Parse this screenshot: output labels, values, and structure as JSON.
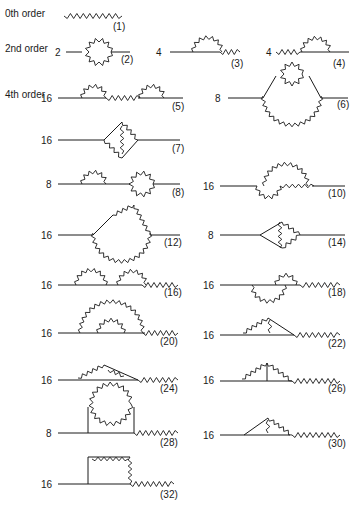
{
  "figure": {
    "order_labels": [
      {
        "text": "0th order",
        "x": 5,
        "y": 17
      },
      {
        "text": "2nd order",
        "x": 5,
        "y": 52
      },
      {
        "text": "4th order",
        "x": 5,
        "y": 98
      }
    ],
    "diagrams": [
      {
        "id": "1",
        "tag": "(1)",
        "weight": "",
        "pos": [
          64,
          12
        ],
        "label_pos": [
          113,
          30
        ]
      },
      {
        "id": "2",
        "tag": "(2)",
        "weight": "2",
        "pos": [
          62,
          52
        ],
        "label_pos": [
          121,
          63
        ]
      },
      {
        "id": "3",
        "tag": "(3)",
        "weight": "4",
        "pos": [
          163,
          52
        ],
        "label_pos": [
          231,
          67
        ]
      },
      {
        "id": "4",
        "tag": "(4)",
        "weight": "4",
        "pos": [
          273,
          52
        ],
        "label_pos": [
          333,
          67
        ]
      },
      {
        "id": "5",
        "tag": "(5)",
        "weight": "16",
        "pos": [
          53,
          98
        ],
        "label_pos": [
          172,
          110
        ]
      },
      {
        "id": "6",
        "tag": "(6)",
        "weight": "8",
        "pos": [
          222,
          98
        ],
        "label_pos": [
          337,
          108
        ]
      },
      {
        "id": "7",
        "tag": "(7)",
        "weight": "16",
        "pos": [
          53,
          140
        ],
        "label_pos": [
          172,
          152
        ]
      },
      {
        "id": "8",
        "tag": "(8)",
        "weight": "8",
        "pos": [
          53,
          184
        ],
        "label_pos": [
          172,
          196
        ]
      },
      {
        "id": "10",
        "tag": "(10)",
        "weight": "16",
        "pos": [
          215,
          186
        ],
        "label_pos": [
          328,
          197
        ]
      },
      {
        "id": "12",
        "tag": "(12)",
        "weight": "16",
        "pos": [
          53,
          235
        ],
        "label_pos": [
          164,
          246
        ]
      },
      {
        "id": "14",
        "tag": "(14)",
        "weight": "8",
        "pos": [
          215,
          235
        ],
        "label_pos": [
          328,
          246
        ]
      },
      {
        "id": "16",
        "tag": "(16)",
        "weight": "16",
        "pos": [
          53,
          285
        ],
        "label_pos": [
          164,
          296
        ]
      },
      {
        "id": "18",
        "tag": "(18)",
        "weight": "16",
        "pos": [
          215,
          285
        ],
        "label_pos": [
          328,
          296
        ]
      },
      {
        "id": "20",
        "tag": "(20)",
        "weight": "16",
        "pos": [
          53,
          333
        ],
        "label_pos": [
          160,
          345
        ]
      },
      {
        "id": "22",
        "tag": "(22)",
        "weight": "16",
        "pos": [
          215,
          335
        ],
        "label_pos": [
          328,
          347
        ]
      },
      {
        "id": "24",
        "tag": "(24)",
        "weight": "16",
        "pos": [
          53,
          380
        ],
        "label_pos": [
          160,
          392
        ]
      },
      {
        "id": "26",
        "tag": "(26)",
        "weight": "16",
        "pos": [
          215,
          380
        ],
        "label_pos": [
          328,
          392
        ]
      },
      {
        "id": "28",
        "tag": "(28)",
        "weight": "8",
        "pos": [
          53,
          433
        ],
        "label_pos": [
          160,
          446
        ]
      },
      {
        "id": "30",
        "tag": "(30)",
        "weight": "16",
        "pos": [
          215,
          435
        ],
        "label_pos": [
          328,
          447
        ]
      },
      {
        "id": "32",
        "tag": "(32)",
        "weight": "16",
        "pos": [
          53,
          484
        ],
        "label_pos": [
          160,
          498
        ]
      }
    ]
  }
}
